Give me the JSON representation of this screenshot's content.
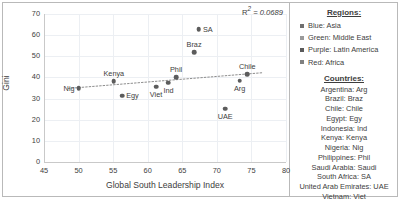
{
  "chart_data": {
    "type": "scatter",
    "title": "",
    "xlabel": "Global South Leadership Index",
    "ylabel": "Gini",
    "xlim": [
      45,
      80
    ],
    "ylim": [
      0,
      70
    ],
    "xticks": [
      45,
      50,
      55,
      60,
      65,
      70,
      75,
      80
    ],
    "yticks": [
      0,
      10,
      20,
      30,
      40,
      50,
      60,
      70
    ],
    "grid": true,
    "annotation": "R² = 0.0689",
    "r2_symbol": "R",
    "r2_sup": "2",
    "r2_value": "= 0.0689",
    "trendline": {
      "type": "linear",
      "style": "dotted",
      "x0": 48.5,
      "y0": 34.8,
      "x1": 76.5,
      "y1": 42.2
    },
    "points": [
      {
        "label": "Nig",
        "x": 50.0,
        "y": 34.8,
        "label_pos": "left"
      },
      {
        "label": "Kenya",
        "x": 55.1,
        "y": 38.1,
        "label_pos": "top"
      },
      {
        "label": "Egy",
        "x": 56.3,
        "y": 31.4,
        "label_pos": "right"
      },
      {
        "label": "Viet",
        "x": 61.2,
        "y": 35.7,
        "label_pos": "bottom"
      },
      {
        "label": "Ind",
        "x": 63.0,
        "y": 37.5,
        "label_pos": "bottom"
      },
      {
        "label": "Phil",
        "x": 64.1,
        "y": 40.1,
        "label_pos": "top"
      },
      {
        "label": "SA",
        "x": 67.4,
        "y": 62.8,
        "label_pos": "right"
      },
      {
        "label": "Braz",
        "x": 66.7,
        "y": 52.0,
        "label_pos": "top"
      },
      {
        "label": "Chile",
        "x": 74.4,
        "y": 41.5,
        "label_pos": "top"
      },
      {
        "label": "Arg",
        "x": 73.3,
        "y": 38.4,
        "label_pos": "bottom"
      },
      {
        "label": "UAE",
        "x": 71.2,
        "y": 25.2,
        "label_pos": "bottom"
      }
    ]
  },
  "legend": {
    "regions_heading": "Regions:",
    "regions": [
      {
        "swatch": "#6f6f6f",
        "text": "Blue: Asia"
      },
      {
        "swatch": "#9a9a9a",
        "text": "Green: Middle East"
      },
      {
        "swatch": "#5a5a5a",
        "text": "Purple: Latin America"
      },
      {
        "swatch": "#808080",
        "text": "Red: Africa"
      }
    ],
    "countries_heading": "Countries:",
    "countries": [
      "Argentina: Arg",
      "Brazil: Braz",
      "Chile: Chile",
      "Egypt: Egy",
      "Indonesia: Ind",
      "Kenya: Kenya",
      "Nigeria: Nig",
      "Philippines: Phil",
      "Saudi Arabia: Saudi",
      "South Africa: SA",
      "United Arab Emirates: UAE",
      "Vietnam: Viet"
    ]
  }
}
